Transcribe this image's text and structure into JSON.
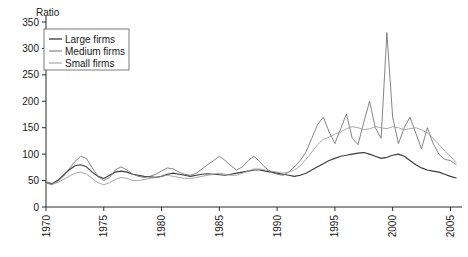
{
  "chart_data": {
    "type": "line",
    "title": "",
    "subtitle": "",
    "ylabel": "Ratio",
    "xlabel": "",
    "ylim": [
      0,
      350
    ],
    "xlim": [
      1970,
      2006
    ],
    "yticks": [
      0,
      50,
      100,
      150,
      200,
      250,
      300,
      350
    ],
    "ytick_labels": [
      "0",
      "50",
      "100",
      "150",
      "200",
      "250",
      "300",
      "350"
    ],
    "xticks": [
      1970,
      1975,
      1980,
      1985,
      1990,
      1995,
      2000,
      2005
    ],
    "xtick_labels": [
      "1970",
      "1975",
      "1980",
      "1985",
      "1990",
      "1995",
      "2000",
      "2005"
    ],
    "xtick_rotation": 90,
    "grid": false,
    "legend_position": "upper left",
    "legend_entries": [
      "Large firms",
      "Medium firms",
      "Small firms"
    ],
    "colors": {
      "large": "#3c3c3c",
      "medium": "#6e6e6e",
      "small": "#9a9a9a",
      "axis": "#2b2b2b",
      "text": "#1a1a1a",
      "background": "#ffffff"
    },
    "x": [
      1970,
      1970.5,
      1971,
      1971.5,
      1972,
      1972.5,
      1973,
      1973.5,
      1974,
      1974.5,
      1975,
      1975.5,
      1976,
      1976.5,
      1977,
      1977.5,
      1978,
      1978.5,
      1979,
      1979.5,
      1980,
      1980.5,
      1981,
      1981.5,
      1982,
      1982.5,
      1983,
      1983.5,
      1984,
      1984.5,
      1985,
      1985.5,
      1986,
      1986.5,
      1987,
      1987.5,
      1988,
      1988.5,
      1989,
      1989.5,
      1990,
      1990.5,
      1991,
      1991.5,
      1992,
      1992.5,
      1993,
      1993.5,
      1994,
      1994.5,
      1995,
      1995.5,
      1996,
      1996.5,
      1997,
      1997.5,
      1998,
      1998.5,
      1999,
      1999.5,
      2000,
      2000.5,
      2001,
      2001.5,
      2002,
      2002.5,
      2003,
      2003.5,
      2004,
      2004.5,
      2005,
      2005.5
    ],
    "series": [
      {
        "name": "Large firms",
        "color": "#3c3c3c",
        "values": [
          47,
          44,
          50,
          60,
          70,
          78,
          80,
          76,
          66,
          58,
          54,
          60,
          66,
          68,
          66,
          62,
          60,
          58,
          57,
          56,
          58,
          62,
          64,
          62,
          60,
          58,
          60,
          62,
          63,
          62,
          61,
          60,
          62,
          64,
          66,
          68,
          70,
          70,
          68,
          66,
          64,
          62,
          60,
          58,
          60,
          64,
          70,
          76,
          82,
          88,
          92,
          96,
          98,
          100,
          102,
          103,
          100,
          96,
          92,
          94,
          98,
          100,
          96,
          88,
          80,
          74,
          70,
          68,
          66,
          62,
          58,
          55
        ]
      },
      {
        "name": "Medium firms",
        "color": "#6e6e6e",
        "values": [
          46,
          42,
          48,
          58,
          72,
          86,
          96,
          92,
          74,
          58,
          50,
          56,
          70,
          76,
          70,
          62,
          58,
          56,
          58,
          62,
          68,
          74,
          72,
          66,
          62,
          60,
          64,
          72,
          80,
          88,
          96,
          88,
          78,
          70,
          76,
          88,
          96,
          86,
          74,
          66,
          62,
          60,
          66,
          76,
          88,
          104,
          130,
          156,
          170,
          142,
          120,
          148,
          176,
          130,
          118,
          160,
          200,
          150,
          130,
          330,
          170,
          120,
          150,
          170,
          140,
          110,
          150,
          120,
          100,
          90,
          88,
          80
        ]
      },
      {
        "name": "Small firms",
        "color": "#9a9a9a",
        "values": [
          48,
          45,
          46,
          52,
          58,
          64,
          66,
          62,
          54,
          46,
          42,
          46,
          52,
          56,
          54,
          50,
          50,
          52,
          54,
          56,
          58,
          60,
          58,
          56,
          54,
          54,
          56,
          58,
          60,
          62,
          64,
          62,
          60,
          60,
          64,
          68,
          72,
          72,
          70,
          68,
          66,
          64,
          66,
          70,
          78,
          90,
          104,
          118,
          128,
          132,
          138,
          142,
          148,
          152,
          150,
          146,
          148,
          152,
          150,
          148,
          152,
          150,
          146,
          148,
          150,
          146,
          140,
          130,
          118,
          106,
          96,
          84
        ]
      }
    ]
  }
}
